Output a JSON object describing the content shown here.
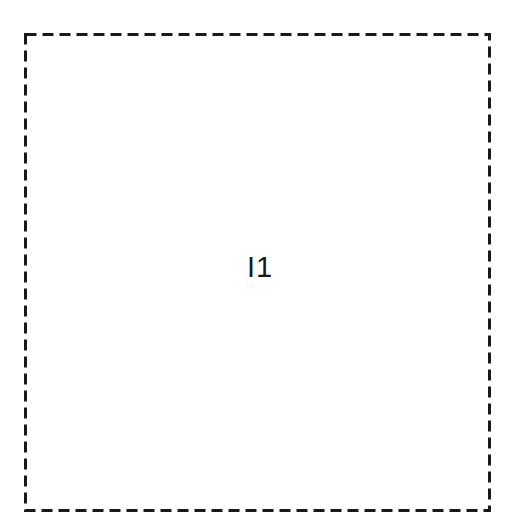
{
  "figure": {
    "background_color": "#ffffff",
    "stroke_color": "#1a1a1a",
    "width": 514,
    "height": 525
  },
  "outer_boundary": {
    "name": "outer-dashed-boundary",
    "shape": "rectangle",
    "style": "dashed",
    "stroke_color": "#1a1a1a",
    "stroke_width": 3,
    "dash_length": 11,
    "gap_length": 6,
    "x": 24,
    "y": 33,
    "width": 464,
    "height": 476,
    "label": ""
  },
  "inner_block": {
    "name": "inner-solid-block",
    "shape": "rectangle",
    "style": "solid",
    "stroke_color": "#1a1a1a",
    "stroke_width": 2,
    "fill_color": "#ffffff",
    "x": 69,
    "y": 78,
    "width": 378,
    "height": 387,
    "label": "I1"
  }
}
